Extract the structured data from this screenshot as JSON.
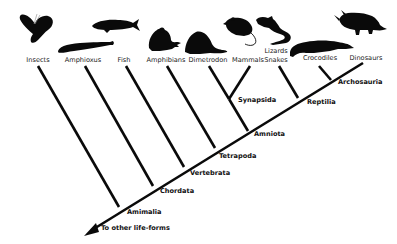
{
  "diagram": {
    "taxa": [
      {
        "id": "insects",
        "label": "Insects",
        "icon": "butterfly-icon"
      },
      {
        "id": "amphioxus",
        "label": "Amphioxus",
        "icon": "lancelet-icon"
      },
      {
        "id": "fish",
        "label": "Fish",
        "icon": "fish-icon"
      },
      {
        "id": "amphibians",
        "label": "Amphibians",
        "icon": "frog-icon"
      },
      {
        "id": "dimetrodon",
        "label": "Dimetrodon",
        "icon": "dimetrodon-icon"
      },
      {
        "id": "mammals",
        "label": "Mammals",
        "icon": "rat-icon"
      },
      {
        "id": "lizards_snakes",
        "label_line1": "Lizards",
        "label_line2": "Snakes",
        "icon": "lizard-icon"
      },
      {
        "id": "crocodiles",
        "label": "Crocodiles",
        "icon": "crocodile-icon"
      },
      {
        "id": "dinosaurs",
        "label": "Dinosaurs",
        "icon": "triceratops-icon"
      }
    ],
    "clades": [
      {
        "id": "animalia",
        "label": "Amimalia"
      },
      {
        "id": "chordata",
        "label": "Chordata"
      },
      {
        "id": "vertebrata",
        "label": "Vertebrata"
      },
      {
        "id": "tetrapoda",
        "label": "Tetrapoda"
      },
      {
        "id": "amniota",
        "label": "Amniota"
      },
      {
        "id": "synapsida",
        "label": "Synapsida"
      },
      {
        "id": "reptilia",
        "label": "Reptilia"
      },
      {
        "id": "archosauria",
        "label": "Archosauria"
      }
    ],
    "root_label": "To other life-forms",
    "colors": {
      "line": "#0a0a0a",
      "text": "#222222",
      "background": "#ffffff"
    }
  }
}
